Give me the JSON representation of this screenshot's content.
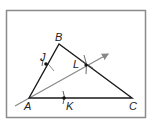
{
  "diagram": {
    "type": "geometry-construction",
    "colors": {
      "frame": "#8a8a8a",
      "triangle": "#1a1a1a",
      "ray": "#888888",
      "points": "#111111"
    },
    "points": {
      "A": {
        "label": "A",
        "x": 29,
        "y": 98
      },
      "B": {
        "label": "B",
        "x": 59,
        "y": 44
      },
      "C": {
        "label": "C",
        "x": 132,
        "y": 98
      },
      "J": {
        "label": "J",
        "x": 46,
        "y": 64
      },
      "K": {
        "label": "K",
        "x": 64,
        "y": 98
      },
      "L": {
        "label": "L",
        "x": 86,
        "y": 65
      }
    },
    "labels": [
      "A",
      "B",
      "C",
      "J",
      "K",
      "L"
    ]
  }
}
